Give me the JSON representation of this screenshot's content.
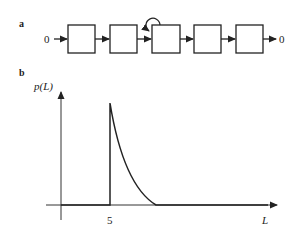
{
  "panel_a": {
    "label": "a",
    "input_label": "0",
    "output_label": "0",
    "box_count": 5,
    "self_loop_box_index": 2
  },
  "panel_b": {
    "label": "b",
    "y_axis_label": "p(L)",
    "x_axis_label": "L",
    "x_tick_label": "5"
  },
  "colors": {
    "stroke": "#222222",
    "background": "#ffffff"
  }
}
